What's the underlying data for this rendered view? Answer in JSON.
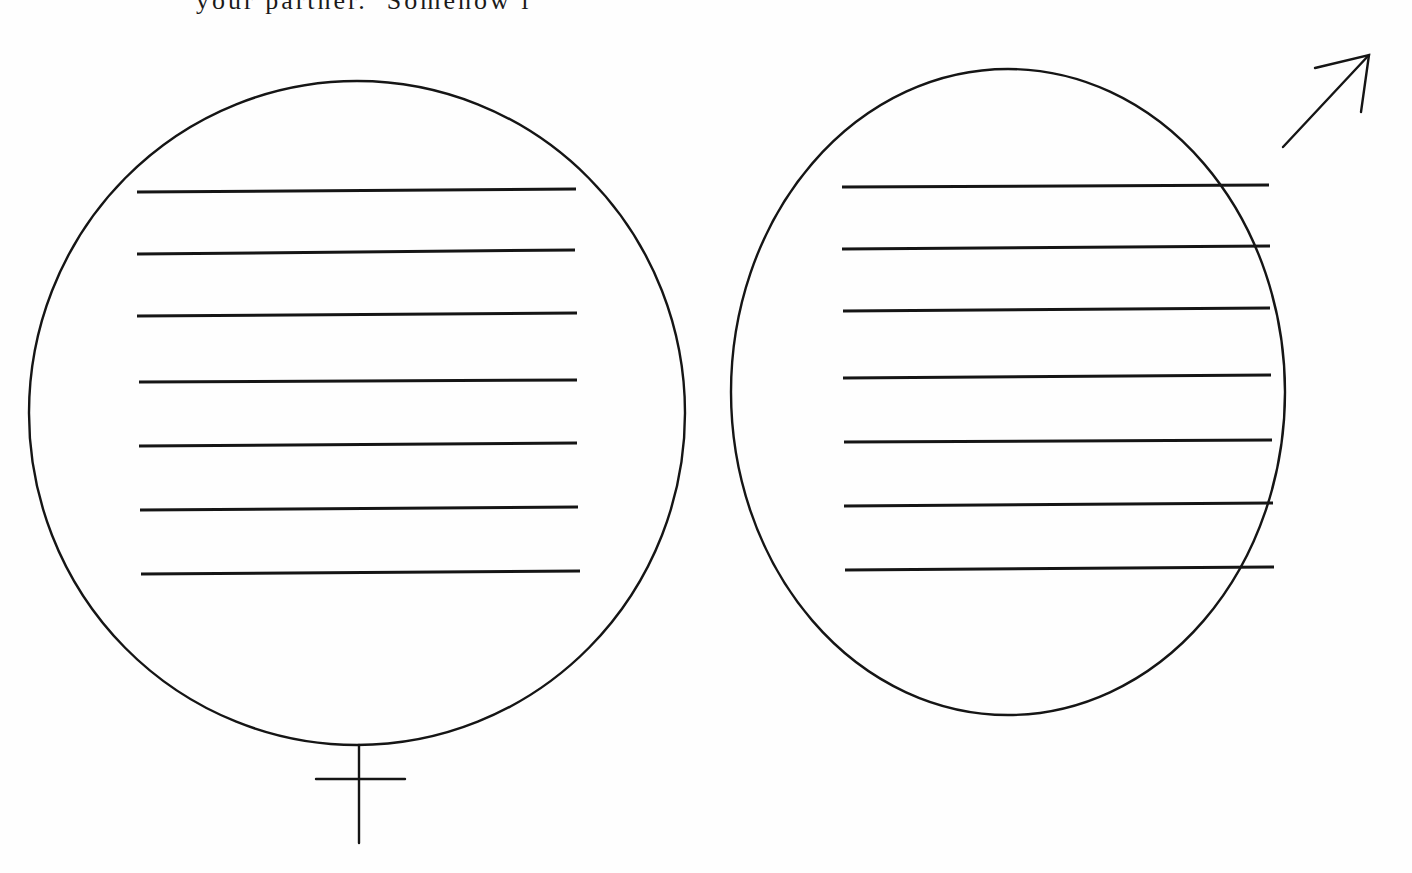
{
  "document": {
    "top_text_fragment": "your partner.  Somehow i",
    "background_color": "#fefefe",
    "ink_color": "#151515"
  },
  "figures": [
    {
      "id": "female",
      "symbol": "♀",
      "label": "female-symbol",
      "circle": {
        "cx": 357,
        "cy": 413,
        "rx": 328,
        "ry": 332
      },
      "cross": {
        "stem_top": 745,
        "stem_bottom": 843,
        "bar_y": 779,
        "bar_x1": 316,
        "bar_x2": 405,
        "stem_x": 359
      },
      "writing_lines": [
        {
          "x1": 137,
          "y1": 192,
          "x2": 576,
          "y2": 189
        },
        {
          "x1": 137,
          "y1": 254,
          "x2": 575,
          "y2": 250
        },
        {
          "x1": 137,
          "y1": 316,
          "x2": 577,
          "y2": 313
        },
        {
          "x1": 139,
          "y1": 382,
          "x2": 577,
          "y2": 380
        },
        {
          "x1": 139,
          "y1": 446,
          "x2": 577,
          "y2": 443
        },
        {
          "x1": 140,
          "y1": 510,
          "x2": 578,
          "y2": 507
        },
        {
          "x1": 141,
          "y1": 574,
          "x2": 580,
          "y2": 571
        }
      ]
    },
    {
      "id": "male",
      "symbol": "♂",
      "label": "male-symbol",
      "circle": {
        "cx": 1008,
        "cy": 392,
        "rx": 277,
        "ry": 323
      },
      "arrow": {
        "x1": 1283,
        "y1": 147,
        "x2": 1369,
        "y2": 55,
        "head_a": [
          1315,
          68
        ],
        "head_b": [
          1361,
          112
        ]
      },
      "writing_lines": [
        {
          "x1": 842,
          "y1": 187,
          "x2": 1269,
          "y2": 185
        },
        {
          "x1": 842,
          "y1": 249,
          "x2": 1270,
          "y2": 246
        },
        {
          "x1": 843,
          "y1": 311,
          "x2": 1270,
          "y2": 308
        },
        {
          "x1": 843,
          "y1": 378,
          "x2": 1271,
          "y2": 375
        },
        {
          "x1": 844,
          "y1": 442,
          "x2": 1272,
          "y2": 440
        },
        {
          "x1": 844,
          "y1": 506,
          "x2": 1273,
          "y2": 503
        },
        {
          "x1": 845,
          "y1": 570,
          "x2": 1274,
          "y2": 567
        }
      ]
    }
  ]
}
